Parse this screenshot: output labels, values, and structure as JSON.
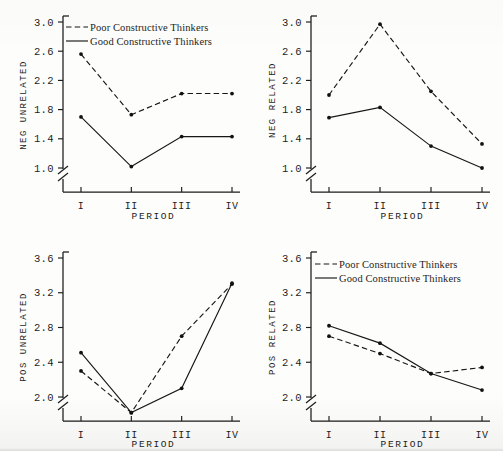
{
  "figure": {
    "panel_count": 4,
    "layout": "2x2",
    "shared_xlabel": "PERIOD",
    "shared_categories": [
      "I",
      "II",
      "III",
      "IV"
    ],
    "legend_entries": [
      {
        "label": "Poor Constructive Thinkers",
        "style": "dashed"
      },
      {
        "label": "Good Constructive Thinkers",
        "style": "solid"
      }
    ],
    "line_color": "#171717",
    "background": "#fdfdfb"
  },
  "chart_data": [
    {
      "type": "line",
      "panel": "top-left",
      "title": "",
      "ylabel": "NEG UNRELATED",
      "xlabel": "PERIOD",
      "categories": [
        "I",
        "II",
        "III",
        "IV"
      ],
      "yticks": [
        1.0,
        1.4,
        1.8,
        2.2,
        2.6,
        3.0
      ],
      "ytick_labels": [
        "1.0",
        "1.4",
        "1.8",
        "2.2",
        "2.6",
        "3.0"
      ],
      "ylim": [
        1.0,
        3.0
      ],
      "axis_break": true,
      "grid": false,
      "legend_position": "upper-left-inside",
      "series": [
        {
          "name": "Poor Constructive Thinkers",
          "style": "dashed",
          "values": [
            2.56,
            1.73,
            2.02,
            2.02
          ]
        },
        {
          "name": "Good Constructive Thinkers",
          "style": "solid",
          "values": [
            1.7,
            1.02,
            1.43,
            1.43
          ]
        }
      ]
    },
    {
      "type": "line",
      "panel": "top-right",
      "title": "",
      "ylabel": "NEG RELATED",
      "xlabel": "PERIOD",
      "categories": [
        "I",
        "II",
        "III",
        "IV"
      ],
      "yticks": [
        1.0,
        1.4,
        1.8,
        2.2,
        2.6,
        3.0
      ],
      "ytick_labels": [
        "1.0",
        "1.4",
        "1.8",
        "2.2",
        "2.6",
        "3.0"
      ],
      "ylim": [
        1.0,
        3.0
      ],
      "axis_break": true,
      "grid": false,
      "legend_position": "none",
      "series": [
        {
          "name": "Poor Constructive Thinkers",
          "style": "dashed",
          "values": [
            2.0,
            2.97,
            2.05,
            1.33
          ]
        },
        {
          "name": "Good Constructive Thinkers",
          "style": "solid",
          "values": [
            1.69,
            1.83,
            1.3,
            1.0
          ]
        }
      ]
    },
    {
      "type": "line",
      "panel": "bottom-left",
      "title": "",
      "ylabel": "POS UNRELATED",
      "xlabel": "PERIOD",
      "categories": [
        "I",
        "II",
        "III",
        "IV"
      ],
      "yticks": [
        2.0,
        2.4,
        2.8,
        3.2,
        3.6
      ],
      "ytick_labels": [
        "2.0",
        "2.4",
        "2.8",
        "3.2",
        "3.6"
      ],
      "ylim": [
        2.0,
        3.6
      ],
      "axis_break": true,
      "grid": false,
      "legend_position": "none",
      "series": [
        {
          "name": "Poor Constructive Thinkers",
          "style": "dashed",
          "values": [
            2.3,
            1.82,
            2.7,
            3.3
          ]
        },
        {
          "name": "Good Constructive Thinkers",
          "style": "solid",
          "values": [
            2.51,
            1.82,
            2.1,
            3.31
          ]
        }
      ]
    },
    {
      "type": "line",
      "panel": "bottom-right",
      "title": "",
      "ylabel": "POS RELATED",
      "xlabel": "PERIOD",
      "categories": [
        "I",
        "II",
        "III",
        "IV"
      ],
      "yticks": [
        2.0,
        2.4,
        2.8,
        3.2,
        3.6
      ],
      "ytick_labels": [
        "2.0",
        "2.4",
        "2.8",
        "3.2",
        "3.6"
      ],
      "ylim": [
        2.0,
        3.6
      ],
      "axis_break": true,
      "grid": false,
      "legend_position": "upper-left-inside",
      "series": [
        {
          "name": "Poor Constructive Thinkers",
          "style": "dashed",
          "values": [
            2.7,
            2.5,
            2.27,
            2.34
          ]
        },
        {
          "name": "Good Constructive Thinkers",
          "style": "solid",
          "values": [
            2.82,
            2.62,
            2.27,
            2.08
          ]
        }
      ]
    }
  ]
}
